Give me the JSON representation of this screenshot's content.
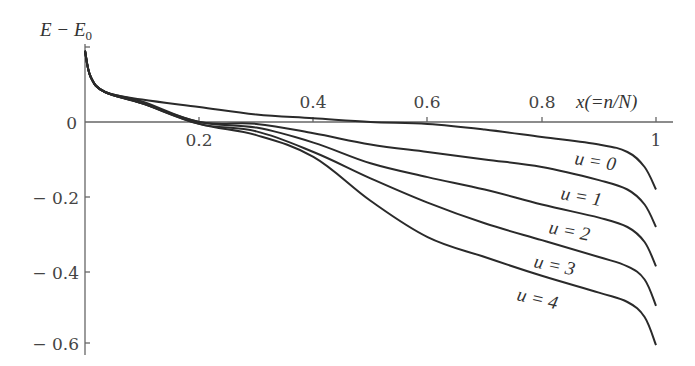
{
  "chart_data": {
    "type": "line",
    "title": "",
    "xlabel": "x(=n/N)",
    "ylabel": "E − E0",
    "xlim": [
      0,
      1.03
    ],
    "ylim": [
      -0.62,
      0.2
    ],
    "grid": false,
    "legend": "inline labels near right end of curves",
    "x_ticks": [
      0.2,
      0.4,
      0.6,
      0.8,
      1
    ],
    "x_tick_labels": [
      "0.2",
      "0.4",
      "0.6",
      "0.8",
      "1"
    ],
    "y_ticks": [
      0,
      -0.2,
      -0.4,
      -0.6
    ],
    "y_tick_labels": [
      "0",
      "− 0.2",
      "− 0.4",
      "− 0.6"
    ],
    "x": [
      0.0,
      0.01,
      0.035,
      0.1,
      0.2,
      0.3,
      0.4,
      0.5,
      0.6,
      0.7,
      0.8,
      0.9,
      0.95,
      0.98,
      1.0
    ],
    "series": [
      {
        "name": "u=0",
        "label": "u = 0",
        "values": [
          0.19,
          0.12,
          0.08,
          0.06,
          0.04,
          0.02,
          0.01,
          0.0,
          -0.005,
          -0.02,
          -0.04,
          -0.06,
          -0.08,
          -0.12,
          -0.18
        ]
      },
      {
        "name": "u=1",
        "label": "u = 1",
        "values": [
          0.19,
          0.12,
          0.08,
          0.055,
          0.0,
          -0.005,
          -0.03,
          -0.06,
          -0.08,
          -0.1,
          -0.12,
          -0.155,
          -0.18,
          -0.22,
          -0.28
        ]
      },
      {
        "name": "u=2",
        "label": "u = 2",
        "values": [
          0.19,
          0.12,
          0.08,
          0.05,
          0.0,
          -0.015,
          -0.055,
          -0.11,
          -0.147,
          -0.18,
          -0.22,
          -0.255,
          -0.28,
          -0.32,
          -0.385
        ]
      },
      {
        "name": "u=3",
        "label": "u = 3",
        "values": [
          0.19,
          0.12,
          0.08,
          0.05,
          -0.005,
          -0.025,
          -0.08,
          -0.15,
          -0.215,
          -0.27,
          -0.315,
          -0.36,
          -0.385,
          -0.42,
          -0.49
        ]
      },
      {
        "name": "u=4",
        "label": "u = 4",
        "values": [
          0.19,
          0.12,
          0.08,
          0.05,
          -0.005,
          -0.035,
          -0.093,
          -0.21,
          -0.307,
          -0.36,
          -0.41,
          -0.455,
          -0.48,
          -0.52,
          -0.595
        ]
      }
    ]
  },
  "labels": {
    "y_axis_title": "E − E",
    "y_axis_sub": "0",
    "x_axis_title": "x(=n/N)",
    "x_ticks": [
      "0.2",
      "0.4",
      "0.6",
      "0.8",
      "1"
    ],
    "y_ticks": [
      "0",
      "− 0.2",
      "− 0.4",
      "− 0.6"
    ],
    "curves": [
      "u = 0",
      "u = 1",
      "u = 2",
      "u = 3",
      "u = 4"
    ]
  }
}
